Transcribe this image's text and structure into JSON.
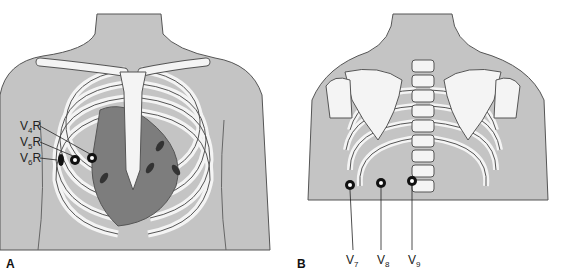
{
  "colors": {
    "skin": "#c4c4c4",
    "outline": "#555555",
    "bone": "#f4f4f4",
    "intercostal": "#a9a9a9",
    "heart": "#7d7d7d",
    "electrode": "#111111"
  },
  "panel_a": {
    "label": "A",
    "leads": [
      {
        "name": "V",
        "sub": "4",
        "suffix": "R"
      },
      {
        "name": "V",
        "sub": "5",
        "suffix": "R"
      },
      {
        "name": "V",
        "sub": "6",
        "suffix": "R"
      }
    ]
  },
  "panel_b": {
    "label": "B",
    "leads": [
      {
        "name": "V",
        "sub": "7"
      },
      {
        "name": "V",
        "sub": "8"
      },
      {
        "name": "V",
        "sub": "9"
      }
    ]
  }
}
